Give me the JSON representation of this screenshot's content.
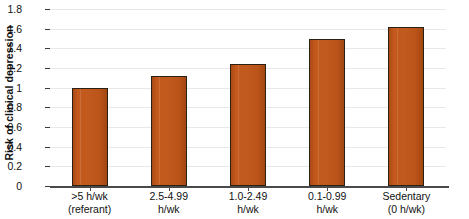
{
  "chart_data": {
    "type": "bar",
    "title": "",
    "xlabel": "",
    "ylabel": "Risk of clinical depression",
    "categories": [
      ">5 h/wk\n(referant)",
      "2.5-4.99\nh/wk",
      "1.0-2.49\nh/wk",
      "0.1-0.99\nh/wk",
      "Sedentary\n(0 h/wk)"
    ],
    "category_lines": [
      [
        ">5 h/wk",
        "(referant)"
      ],
      [
        "2.5-4.99",
        "h/wk"
      ],
      [
        "1.0-2.49",
        "h/wk"
      ],
      [
        "0.1-0.99",
        "h/wk"
      ],
      [
        "Sedentary",
        "(0 h/wk)"
      ]
    ],
    "values": [
      1.0,
      1.12,
      1.24,
      1.49,
      1.62
    ],
    "ylim": [
      0,
      1.8
    ],
    "yticks": [
      0,
      0.2,
      0.4,
      0.6,
      0.8,
      1,
      1.2,
      1.4,
      1.6,
      1.8
    ],
    "ytick_labels": [
      "0",
      "0.2",
      "0.4",
      "0.6",
      "0.8",
      "1",
      "1.2",
      "1.4",
      "1.6",
      "1.8"
    ],
    "grid": true,
    "legend": null,
    "bar_color": "#C0591C",
    "bar_edge_color": "#2B2112",
    "axis_color": "#1A1A1A",
    "gridline_color": "#E8E8E8",
    "background_color": "#FFFFFF"
  }
}
